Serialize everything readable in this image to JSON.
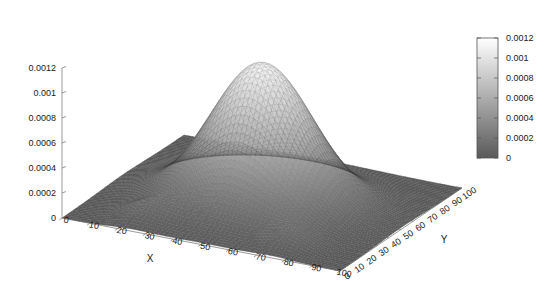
{
  "figure": {
    "title": "",
    "background_color": "#ffffff",
    "width": 554,
    "height": 281
  },
  "chart_data": {
    "type": "surface",
    "render": "wireframe-mesh-3d",
    "title": "",
    "subtitle": "",
    "xlabel": "X",
    "ylabel": "Y",
    "zlabel": "",
    "xlim": [
      0,
      100
    ],
    "ylim": [
      0,
      100
    ],
    "zlim": [
      0,
      0.0012
    ],
    "grid": false,
    "legend": "none",
    "projection": {
      "view_rot_x_deg": 60,
      "view_rot_z_deg": 30,
      "note": "standard gnuplot splot view, z axis vertical at left"
    },
    "xticks": [
      0,
      10,
      20,
      30,
      40,
      50,
      60,
      70,
      80,
      90,
      100
    ],
    "xticklabels": [
      "0",
      "10",
      "20",
      "30",
      "40",
      "50",
      "60",
      "70",
      "80",
      "90",
      "100"
    ],
    "yticks": [
      0,
      10,
      20,
      30,
      40,
      50,
      60,
      70,
      80,
      90,
      100
    ],
    "yticklabels": [
      "0",
      "10",
      "20",
      "30",
      "40",
      "50",
      "60",
      "70",
      "80",
      "90",
      "100"
    ],
    "zticks": [
      0,
      0.0002,
      0.0004,
      0.0006,
      0.0008,
      0.001,
      0.0012
    ],
    "zticklabels": [
      "0",
      "0.0002",
      "0.0004",
      "0.0006",
      "0.0008",
      "0.001",
      "0.0012"
    ],
    "colormap": {
      "name": "gray",
      "low_color": "#5a5a5a",
      "high_color": "#ffffff",
      "vmin": 0,
      "vmax": 0.0012
    },
    "colorbar": {
      "orientation": "vertical",
      "position": "right",
      "ticks": [
        0,
        0.0002,
        0.0004,
        0.0006,
        0.0008,
        0.001,
        0.0012
      ],
      "ticklabels": [
        "0",
        "0.0002",
        "0.0004",
        "0.0006",
        "0.0008",
        "0.001",
        "0.0012"
      ],
      "border_color": "#555555"
    },
    "surface_model": {
      "description": "sum of gaussian bumps on a 100x100 grid; dominant central peak plus two small symmetric side bumps",
      "grid_n": 64,
      "components": [
        {
          "amp": 0.00112,
          "cx": 50,
          "cy": 50,
          "sx": 17,
          "sy": 17
        },
        {
          "amp": 0.0001,
          "cx": 24,
          "cy": 14,
          "sx": 7,
          "sy": 7
        },
        {
          "amp": 0.0001,
          "cx": 76,
          "cy": 14,
          "sx": 7,
          "sy": 7
        }
      ],
      "zmax_observed": 0.00115,
      "zmin_observed": 0.0
    },
    "mesh_style": {
      "line_color_mode": "colormap-shaded",
      "line_width": 0.35,
      "hidden_line_removal": true
    }
  },
  "axes": {
    "x_axis_name": "X",
    "y_axis_name": "Y",
    "z_axis_name": ""
  }
}
